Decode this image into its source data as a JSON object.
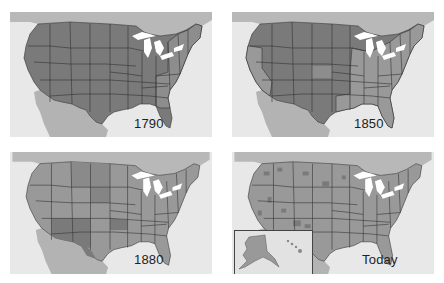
{
  "figure": {
    "colors": {
      "background": "#ffffff",
      "ocean": "#e8e8e8",
      "foreign_land": "#b3b3b3",
      "territory_dark": "#7a7a7a",
      "state_light": "#999999",
      "great_lakes": "#ffffff",
      "border": "#333333"
    },
    "panels": [
      {
        "id": "p1790",
        "label": "1790",
        "position": "top-left"
      },
      {
        "id": "p1850",
        "label": "1850",
        "position": "top-right"
      },
      {
        "id": "p1880",
        "label": "1880",
        "position": "bottom-left"
      },
      {
        "id": "ptoday",
        "label": "Today",
        "position": "bottom-right",
        "insets": [
          "Alaska",
          "Hawaii"
        ]
      }
    ]
  }
}
